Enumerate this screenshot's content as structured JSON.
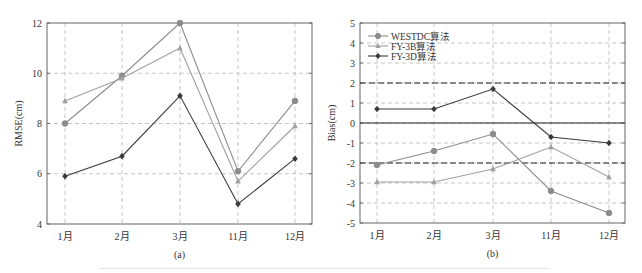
{
  "colors": {
    "westdc": "#8c8c8c",
    "fy3b": "#a0a0a0",
    "fy3d": "#3a3a3a",
    "grid": "#b8b8b8",
    "frame": "#555555",
    "threshold": "#222222"
  },
  "chart_data": [
    {
      "type": "line",
      "panel_label": "(a)",
      "title": "",
      "xlabel": "",
      "ylabel": "RMSE(cm)",
      "categories": [
        "1月",
        "2月",
        "3月",
        "11月",
        "12月"
      ],
      "ylim": [
        4,
        12
      ],
      "yticks": [
        4,
        6,
        8,
        10,
        12
      ],
      "grid": true,
      "legend": null,
      "series": [
        {
          "name": "WESTDC算法",
          "marker": "circle",
          "values": [
            8.0,
            9.9,
            12.0,
            6.1,
            8.9
          ]
        },
        {
          "name": "FY-3B算法",
          "marker": "triangle",
          "values": [
            8.9,
            9.8,
            11.0,
            5.7,
            7.9
          ]
        },
        {
          "name": "FY-3D算法",
          "marker": "diamond",
          "values": [
            5.9,
            6.7,
            9.1,
            4.8,
            6.6
          ]
        }
      ]
    },
    {
      "type": "line",
      "panel_label": "(b)",
      "title": "",
      "xlabel": "",
      "ylabel": "Bias(cm)",
      "categories": [
        "1月",
        "2月",
        "3月",
        "11月",
        "12月"
      ],
      "ylim": [
        -5,
        5
      ],
      "yticks": [
        -5,
        -4,
        -3,
        -2,
        -1,
        0,
        1,
        2,
        3,
        4,
        5
      ],
      "grid": true,
      "legend": "upper left",
      "reference_lines": [
        {
          "y": 2,
          "style": "dashed"
        },
        {
          "y": 0,
          "style": "solid"
        },
        {
          "y": -2,
          "style": "dashed"
        }
      ],
      "series": [
        {
          "name": "WESTDC算法",
          "marker": "circle",
          "values": [
            -2.1,
            -1.4,
            -0.55,
            -3.4,
            -4.5
          ]
        },
        {
          "name": "FY-3B算法",
          "marker": "triangle",
          "values": [
            -2.95,
            -2.95,
            -2.3,
            -1.2,
            -2.7
          ]
        },
        {
          "name": "FY-3D算法",
          "marker": "diamond",
          "values": [
            0.7,
            0.7,
            1.7,
            -0.7,
            -1.0
          ]
        }
      ]
    }
  ]
}
